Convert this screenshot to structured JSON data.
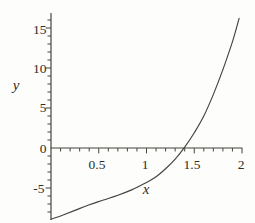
{
  "chart_data": {
    "type": "line",
    "title": "",
    "xlabel": "x",
    "ylabel": "y",
    "xlim": [
      0,
      2
    ],
    "ylim": [
      -8.9,
      16.8
    ],
    "x_tick_labels": [
      "0.5",
      "1",
      "1.5",
      "2"
    ],
    "x_tick_values": [
      0.5,
      1,
      1.5,
      2
    ],
    "x_minor_step": 0.1,
    "y_tick_labels": [
      "15",
      "10",
      "5",
      "0",
      "-5"
    ],
    "y_tick_values": [
      15,
      10,
      5,
      0,
      -5
    ],
    "y_minor_step": 1,
    "grid": false,
    "legend": "none",
    "axis_style": "crossed-at-origin, ticks below x-axis and left of y-axis",
    "series": [
      {
        "name": "curve",
        "points": [
          [
            0,
            -8.9
          ],
          [
            0.12,
            -8.4
          ],
          [
            0.25,
            -7.8
          ],
          [
            0.4,
            -7.1
          ],
          [
            0.55,
            -6.5
          ],
          [
            0.7,
            -5.9
          ],
          [
            0.85,
            -5.2
          ],
          [
            1.0,
            -4.3
          ],
          [
            1.1,
            -3.6
          ],
          [
            1.2,
            -2.6
          ],
          [
            1.3,
            -1.4
          ],
          [
            1.4,
            0.1
          ],
          [
            1.5,
            1.9
          ],
          [
            1.6,
            4.0
          ],
          [
            1.7,
            6.7
          ],
          [
            1.8,
            9.8
          ],
          [
            1.9,
            13.3
          ],
          [
            1.97,
            16.2
          ]
        ]
      }
    ],
    "colors": {
      "ink": "#45433f",
      "background": "#fdfdfb"
    }
  }
}
